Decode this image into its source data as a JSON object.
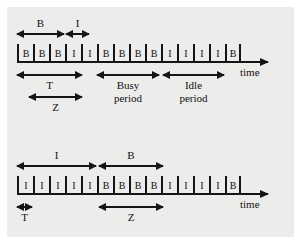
{
  "figure": {
    "background_color": "#ececeb",
    "ink_color": "#151515",
    "axis_time_label_top": "time",
    "axis_time_label_bottom": "time"
  },
  "diagram_top": {
    "slots": [
      {
        "label": "B"
      },
      {
        "label": "B"
      },
      {
        "label": "B"
      },
      {
        "label": "I"
      },
      {
        "label": "I"
      },
      {
        "label": "B"
      },
      {
        "label": "B"
      },
      {
        "label": "B"
      },
      {
        "label": "B"
      },
      {
        "label": "I"
      },
      {
        "label": "I"
      },
      {
        "label": "I"
      },
      {
        "label": "I"
      },
      {
        "label": "B"
      }
    ],
    "annotations_above": [
      {
        "label": "B"
      },
      {
        "label": "I"
      }
    ],
    "annotations_below": [
      {
        "label": "T"
      },
      {
        "label": "Z"
      },
      {
        "label": "Busy period",
        "line1": "Busy",
        "line2": "period"
      },
      {
        "label": "Idle period",
        "line1": "Idle",
        "line2": "period"
      }
    ]
  },
  "diagram_bottom": {
    "slots": [
      {
        "label": "I"
      },
      {
        "label": "I"
      },
      {
        "label": "I"
      },
      {
        "label": "I"
      },
      {
        "label": "I"
      },
      {
        "label": "B"
      },
      {
        "label": "B"
      },
      {
        "label": "B"
      },
      {
        "label": "B"
      },
      {
        "label": "I"
      },
      {
        "label": "I"
      },
      {
        "label": "I"
      },
      {
        "label": "I"
      },
      {
        "label": "B"
      }
    ],
    "annotations_above": [
      {
        "label": "I"
      },
      {
        "label": "B"
      }
    ],
    "annotations_below": [
      {
        "label": "T"
      },
      {
        "label": "Z"
      }
    ]
  }
}
